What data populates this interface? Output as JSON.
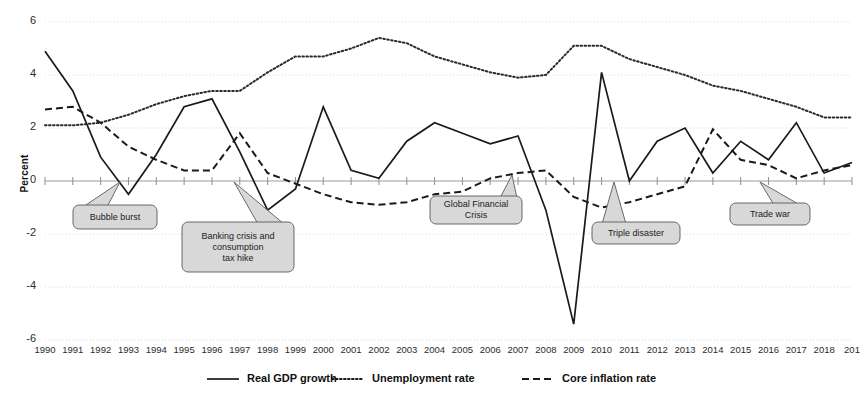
{
  "chart_data": {
    "type": "line",
    "title": "",
    "xlabel": "",
    "ylabel": "Percent",
    "ylim": [
      -6,
      6
    ],
    "yticks": [
      6,
      4,
      2,
      0,
      -2,
      -4,
      -6
    ],
    "grid": true,
    "legend_position": "bottom",
    "x_truncated_last_label": "201",
    "categories": [
      "1990",
      "1991",
      "1992",
      "1993",
      "1994",
      "1995",
      "1996",
      "1997",
      "1998",
      "1999",
      "2000",
      "2001",
      "2002",
      "2003",
      "2004",
      "2005",
      "2006",
      "2007",
      "2008",
      "2009",
      "2010",
      "2011",
      "2012",
      "2013",
      "2014",
      "2015",
      "2016",
      "2017",
      "2018",
      "2019"
    ],
    "series": [
      {
        "name": "Real GDP growth",
        "style": "solid",
        "color": "#1a1a1a",
        "values": [
          4.9,
          3.4,
          0.9,
          -0.5,
          1.0,
          2.8,
          3.1,
          1.1,
          -1.1,
          -0.3,
          2.8,
          0.4,
          0.1,
          1.5,
          2.2,
          1.8,
          1.4,
          1.7,
          -1.1,
          -5.4,
          4.1,
          0.0,
          1.5,
          2.0,
          0.3,
          1.5,
          0.8,
          2.2,
          0.3,
          0.7
        ]
      },
      {
        "name": "Unemployment rate",
        "style": "dotted",
        "color": "#2b2b2b",
        "values": [
          2.1,
          2.1,
          2.2,
          2.5,
          2.9,
          3.2,
          3.4,
          3.4,
          4.1,
          4.7,
          4.7,
          5.0,
          5.4,
          5.2,
          4.7,
          4.4,
          4.1,
          3.9,
          4.0,
          5.1,
          5.1,
          4.6,
          4.3,
          4.0,
          3.6,
          3.4,
          3.1,
          2.8,
          2.4,
          2.4
        ]
      },
      {
        "name": "Core inflation rate",
        "style": "dashed",
        "color": "#1a1a1a",
        "values": [
          2.7,
          2.8,
          2.2,
          1.3,
          0.8,
          0.4,
          0.4,
          1.8,
          0.3,
          -0.1,
          -0.5,
          -0.8,
          -0.9,
          -0.8,
          -0.5,
          -0.4,
          0.1,
          0.3,
          0.4,
          -0.6,
          -1.0,
          -0.8,
          -0.5,
          -0.2,
          1.95,
          0.8,
          0.6,
          0.1,
          0.4,
          0.6
        ]
      }
    ],
    "annotations": [
      {
        "label": "Bubble burst",
        "year": "1993",
        "value": 0
      },
      {
        "label": "Banking crisis and consumption tax hike",
        "year": "1997",
        "value": 0
      },
      {
        "label": "Global Financial Crisis",
        "year": "2008",
        "value": 0
      },
      {
        "label": "Triple disaster",
        "year": "2011",
        "value": 0
      },
      {
        "label": "Trade war",
        "year": "2018",
        "value": 0
      }
    ]
  },
  "axis": {
    "ylabel": "Percent",
    "yticks": [
      "6",
      "4",
      "2",
      "0",
      "-2",
      "-4",
      "-6"
    ],
    "xticks": [
      "1990",
      "1991",
      "1992",
      "1993",
      "1994",
      "1995",
      "1996",
      "1997",
      "1998",
      "1999",
      "2000",
      "2001",
      "2002",
      "2003",
      "2004",
      "2005",
      "2006",
      "2007",
      "2008",
      "2009",
      "2010",
      "2011",
      "2012",
      "2013",
      "2014",
      "2015",
      "2016",
      "2017",
      "2018",
      "201"
    ]
  },
  "legend": [
    {
      "label": "Real GDP growth",
      "style": "solid"
    },
    {
      "label": "Unemployment rate",
      "style": "dotted"
    },
    {
      "label": "Core inflation rate",
      "style": "dashed"
    }
  ],
  "annotations": [
    {
      "label": "Bubble burst"
    },
    {
      "label_line1": "Banking crisis and",
      "label_line2": "consumption",
      "label_line3": "tax hike"
    },
    {
      "label_line1": "Global Financial",
      "label_line2": "Crisis"
    },
    {
      "label": "Triple disaster"
    },
    {
      "label": "Trade war"
    }
  ],
  "colors": {
    "gdp": "#1a1a1a",
    "unemployment": "#2b2b2b",
    "inflation": "#1a1a1a",
    "grid": "#d9d9d9",
    "callout_fill": "#d8d8d8",
    "callout_stroke": "#5a5a5a"
  }
}
